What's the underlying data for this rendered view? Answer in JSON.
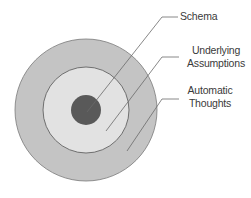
{
  "diagram": {
    "type": "concentric-circles",
    "layers": [
      {
        "name": "Automatic Thoughts",
        "level": "outer",
        "color": "#c4c4c4"
      },
      {
        "name": "Underlying Assumptions",
        "level": "middle",
        "color": "#e2e2e2"
      },
      {
        "name": "Schema",
        "level": "core",
        "color": "#595959"
      }
    ],
    "labels": {
      "schema": "Schema",
      "underlying_line1": "Underlying",
      "underlying_line2": "Assumptions",
      "automatic_line1": "Automatic",
      "automatic_line2": "Thoughts"
    },
    "colors": {
      "outer_fill": "#c4c4c4",
      "middle_fill": "#e2e2e2",
      "core_fill": "#595959",
      "stroke": "#6e6e6e",
      "leader": "#6a6a6a"
    }
  }
}
